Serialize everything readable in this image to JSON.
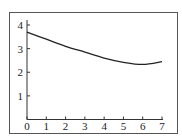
{
  "chart_data": {
    "type": "line",
    "title": "",
    "xlabel": "",
    "ylabel": "",
    "xlim": [
      0,
      7
    ],
    "ylim": [
      0,
      4
    ],
    "grid": false,
    "legend": null,
    "x_ticks": [
      "0",
      "1",
      "2",
      "3",
      "4",
      "5",
      "6",
      "7"
    ],
    "y_ticks": [
      "1",
      "2",
      "3",
      "4"
    ],
    "series": [
      {
        "name": "curve",
        "x": [
          0,
          1,
          2,
          3,
          4,
          5,
          6,
          7
        ],
        "y": [
          3.7,
          3.4,
          3.1,
          2.85,
          2.6,
          2.42,
          2.33,
          2.45
        ]
      }
    ]
  },
  "colors": {
    "line": "#222222",
    "frame": "#444444"
  }
}
